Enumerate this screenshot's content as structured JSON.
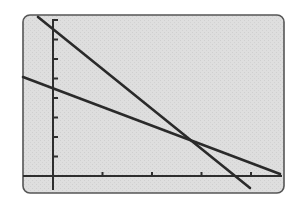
{
  "chart_data": {
    "type": "line",
    "title": "",
    "xlabel": "",
    "ylabel": "",
    "grid": false,
    "legend": null,
    "frame": {
      "style": "graphing-calculator screen",
      "background": "#dcdcdc",
      "border": "#555555",
      "rounded_corners": true
    },
    "axes": {
      "x_ticks": [
        1,
        2,
        3,
        4
      ],
      "y_ticks": [
        1,
        2,
        3,
        4,
        5,
        6,
        7,
        8
      ],
      "tick_labels_shown": false,
      "xlim": [
        -0.6,
        4.6
      ],
      "ylim": [
        -0.7,
        8.1
      ]
    },
    "series": [
      {
        "name": "steep line",
        "description": "steeper decreasing line",
        "x": [
          -0.3,
          4.0
        ],
        "y": [
          8.0,
          -0.6
        ],
        "y_intercept": 7.5,
        "x_intercept": 3.7,
        "color": "#2a2a2a"
      },
      {
        "name": "shallow line",
        "description": "less steep decreasing line",
        "x": [
          -0.6,
          4.6
        ],
        "y": [
          5.1,
          0.1
        ],
        "y_intercept": 4.5,
        "x_intercept": 4.7,
        "color": "#2a2a2a"
      }
    ],
    "annotations": [
      {
        "type": "intersection",
        "x": 2.7,
        "y": 1.9,
        "label": ""
      }
    ]
  },
  "render": {
    "origin_px": [
      53,
      176
    ],
    "x_unit_px": 49.5,
    "y_unit_px": 19.5,
    "frame_px": {
      "x": 23,
      "y": 15,
      "w": 261,
      "h": 178,
      "r": 7
    },
    "y_axis_px": {
      "top": 19,
      "bottom": 190
    },
    "x_axis_px": {
      "left": 23,
      "right": 282
    },
    "lines_px": [
      {
        "x1": 38,
        "y1": 17,
        "x2": 250,
        "y2": 188
      },
      {
        "x1": 23,
        "y1": 77,
        "x2": 280,
        "y2": 174
      }
    ]
  }
}
